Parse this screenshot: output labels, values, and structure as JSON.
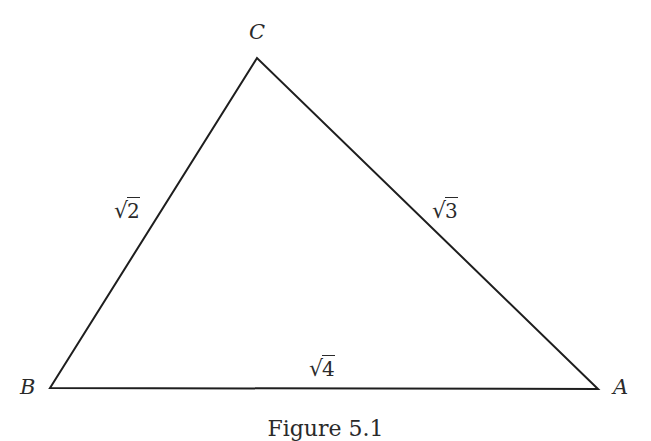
{
  "figure": {
    "caption": "Figure 5.1",
    "line_color": "#1e1e1e",
    "vertices": {
      "A": {
        "label": "A",
        "x": 598,
        "y": 389
      },
      "B": {
        "label": "B",
        "x": 50,
        "y": 388
      },
      "C": {
        "label": "C",
        "x": 257,
        "y": 58
      }
    },
    "edges": {
      "BC": {
        "radical": "√",
        "value": "2"
      },
      "CA": {
        "radical": "√",
        "value": "3"
      },
      "BA": {
        "radical": "√",
        "value": "4"
      }
    }
  }
}
